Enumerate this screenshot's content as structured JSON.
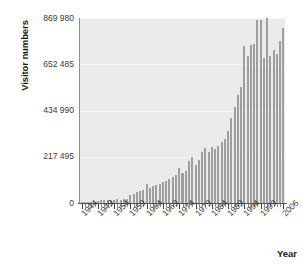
{
  "chart_data": {
    "type": "bar",
    "title": "",
    "xlabel": "Year",
    "ylabel": "Visitor numbers",
    "ylim": [
      0,
      869980
    ],
    "yticks": [
      0,
      217495,
      434990,
      652485,
      869980
    ],
    "ytick_labels": [
      "0",
      "217 495",
      "434 990",
      "652 485",
      "869 980"
    ],
    "grid": true,
    "legend": "none",
    "bar_color": "#9e9e9e",
    "plot_background": "#eaeaea",
    "xtick_labels": [
      "1944",
      "1949",
      "1954",
      "1959",
      "1964",
      "1969",
      "1974",
      "1979",
      "1984",
      "1989",
      "1994",
      "1999",
      "2006"
    ],
    "xtick_years": [
      1944,
      1949,
      1954,
      1959,
      1964,
      1969,
      1974,
      1979,
      1984,
      1989,
      1994,
      1999,
      2006
    ],
    "categories": [
      1944,
      1945,
      1946,
      1947,
      1948,
      1949,
      1950,
      1951,
      1952,
      1953,
      1954,
      1955,
      1956,
      1957,
      1958,
      1959,
      1960,
      1961,
      1962,
      1963,
      1964,
      1965,
      1966,
      1967,
      1968,
      1969,
      1970,
      1971,
      1972,
      1973,
      1974,
      1975,
      1976,
      1977,
      1978,
      1979,
      1980,
      1981,
      1982,
      1983,
      1984,
      1985,
      1986,
      1987,
      1988,
      1989,
      1990,
      1991,
      1992,
      1993,
      1994,
      1995,
      1996,
      1997,
      1998,
      1999,
      2000,
      2001,
      2002,
      2003,
      2004,
      2005,
      2006
    ],
    "values": [
      2000,
      2500,
      3000,
      4000,
      5000,
      9000,
      12000,
      14000,
      13000,
      15000,
      16000,
      18000,
      15000,
      17000,
      19000,
      38000,
      44000,
      50000,
      57000,
      63000,
      88000,
      72000,
      78000,
      84000,
      90000,
      97000,
      104000,
      112000,
      120000,
      130000,
      165000,
      140000,
      150000,
      196000,
      215000,
      181000,
      200000,
      240000,
      257000,
      238000,
      262000,
      255000,
      270000,
      285000,
      300000,
      340000,
      400000,
      450000,
      510000,
      545000,
      740000,
      690000,
      745000,
      750000,
      860000,
      860000,
      680000,
      870000,
      690000,
      720000,
      700000,
      760000,
      825000
    ]
  },
  "axis": {
    "y_title": "Visitor numbers",
    "x_title": "Year"
  }
}
